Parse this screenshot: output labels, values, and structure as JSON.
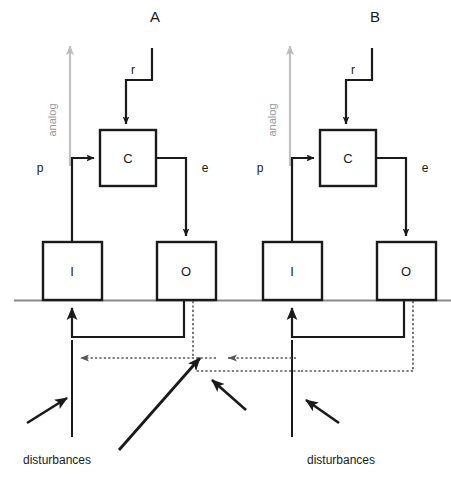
{
  "figure": {
    "title": "",
    "sections": [
      {
        "id": "A",
        "label": "A",
        "origin_x": 0,
        "blocks": [
          {
            "name": "controller",
            "label": "C"
          },
          {
            "name": "input",
            "label": "I"
          },
          {
            "name": "output",
            "label": "O"
          }
        ],
        "signals": [
          {
            "name": "reference",
            "label": "r"
          },
          {
            "name": "perception",
            "label": "p"
          },
          {
            "name": "error-output",
            "label": "e"
          }
        ],
        "axis_label": "analog",
        "disturbances_label": "disturbances"
      },
      {
        "id": "B",
        "label": "B",
        "origin_x": 217,
        "blocks": [
          {
            "name": "controller",
            "label": "C"
          },
          {
            "name": "input",
            "label": "I"
          },
          {
            "name": "output",
            "label": "O"
          }
        ],
        "signals": [
          {
            "name": "reference",
            "label": "r"
          },
          {
            "name": "perception",
            "label": "p"
          },
          {
            "name": "error-output",
            "label": "e"
          }
        ],
        "axis_label": "analog",
        "disturbances_label": "disturbances"
      }
    ],
    "colors": {
      "line": "#1a1a1a",
      "ground_line": "#8a8a8a",
      "analog_axis": "#b9b9b9",
      "dotted_link": "#6e6e6e",
      "background": "#ffffff"
    }
  }
}
